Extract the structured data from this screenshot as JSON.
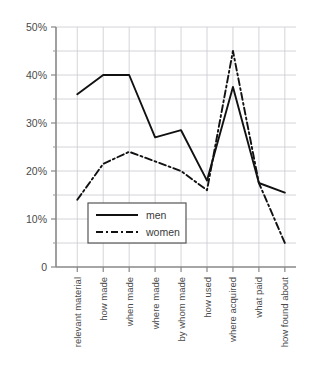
{
  "chart_data": {
    "type": "line",
    "title": "",
    "xlabel": "",
    "ylabel": "",
    "grid": true,
    "legend_position": "inside-lower-left",
    "ylim": [
      0,
      50
    ],
    "ytick_labels": [
      "0",
      "10%",
      "20%",
      "30%",
      "40%",
      "50%"
    ],
    "ytick_values": [
      0,
      10,
      20,
      30,
      40,
      50
    ],
    "yminor_values": [
      5,
      15,
      25,
      35,
      45
    ],
    "categories": [
      "relevant material",
      "how made",
      "when made",
      "where made",
      "by whom made",
      "how used",
      "where acquired",
      "what paid",
      "how found about"
    ],
    "series": [
      {
        "name": "men",
        "style": "solid",
        "color": "#111111",
        "values": [
          36,
          40,
          40,
          27,
          28.5,
          18,
          37.5,
          17.5,
          15.5
        ]
      },
      {
        "name": "women",
        "style": "dash-dot",
        "color": "#111111",
        "values": [
          14,
          21.5,
          24,
          22,
          20,
          16,
          45,
          17.5,
          5
        ]
      }
    ]
  },
  "legend": {
    "entries": [
      {
        "label": "men"
      },
      {
        "label": "women"
      }
    ]
  }
}
